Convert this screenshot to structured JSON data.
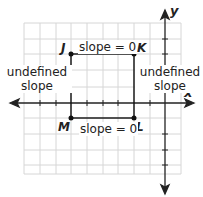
{
  "diagram": {
    "axes": {
      "x_label": "x",
      "y_label": "y"
    },
    "points": {
      "J": "J",
      "K": "K",
      "L": "L",
      "M": "M"
    },
    "labels": {
      "top": "slope = 0",
      "bottom": "slope = 0",
      "left_line1": "undefined",
      "left_line2": "slope",
      "right_line1": "undefined",
      "right_line2": "slope"
    },
    "colors": {
      "grid": "#d6d6d6",
      "axis": "#222222",
      "rect": "#111111"
    }
  }
}
